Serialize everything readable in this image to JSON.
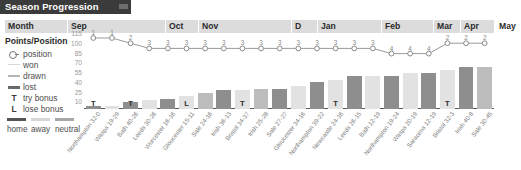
{
  "title": "Season Progression",
  "months": [
    {
      "label": "Month",
      "x": 0,
      "w": 62
    },
    {
      "label": "Sep",
      "x": 62,
      "w": 98
    },
    {
      "label": "Oct",
      "x": 160,
      "w": 33
    },
    {
      "label": "Nov",
      "x": 193,
      "w": 93
    },
    {
      "label": "D",
      "x": 286,
      "w": 26
    },
    {
      "label": "Jan",
      "x": 312,
      "w": 64
    },
    {
      "label": "Feb",
      "x": 376,
      "w": 0
    },
    {
      "label": "Mar",
      "x": 376,
      "w": 0
    },
    {
      "label": "Apr",
      "x": 376,
      "w": 0
    },
    {
      "label": "May",
      "x": 376,
      "w": 0
    }
  ],
  "legend": {
    "title": "Points/Position",
    "items": [
      {
        "glyph": "position-marker",
        "label": "position"
      },
      {
        "glyph": "line-won",
        "label": "won"
      },
      {
        "glyph": "line-drawn",
        "label": "drawn"
      },
      {
        "glyph": "line-lost",
        "label": "lost"
      },
      {
        "glyph": "T",
        "label": "try bonus"
      },
      {
        "glyph": "L",
        "label": "lose bonus"
      }
    ],
    "venue_key": [
      {
        "label": "home",
        "color": "#555555"
      },
      {
        "label": "away",
        "color": "#d6d6d6"
      },
      {
        "label": "neutral",
        "color": "#a8a8a8"
      }
    ]
  },
  "chart_data": {
    "type": "bar",
    "title": "Season Progression",
    "xlabel": "",
    "ylabel": "Points/Position",
    "ylim": [
      0,
      115
    ],
    "yticks": [
      115,
      100,
      85,
      70,
      55,
      40,
      25,
      10
    ],
    "grid": false,
    "legend_position": "left",
    "categories": [
      "Northampton 32-0",
      "Wasps 19-29",
      "Bath 40-26",
      "Leeds 30-26",
      "Worcester 16-16",
      "Gloucester 15-11",
      "Sale 24-16",
      "Irish 36-13",
      "Bristol 34-37",
      "Irish 25-28",
      "Sale 27-27",
      "Gloucester 34-16",
      "Northampton 39-22",
      "Newcastle 24-16",
      "Leeds 26-15",
      "Bath 12-19",
      "Northampton 19-24",
      "Wasps 20-19",
      "Saracens 12-19",
      "Bristol 32-3",
      "Irish 40-8",
      "Sale 30-45"
    ],
    "series": [
      {
        "name": "points",
        "type": "bar",
        "values": [
          5,
          5,
          10,
          14,
          16,
          20,
          25,
          29,
          29,
          30,
          31,
          36,
          41,
          45,
          50,
          50,
          50,
          55,
          55,
          60,
          65,
          65
        ]
      },
      {
        "name": "position",
        "type": "line",
        "values": [
          1,
          1,
          2,
          3,
          3,
          3,
          3,
          3,
          3,
          3,
          3,
          3,
          3,
          3,
          3,
          3,
          4,
          4,
          4,
          2,
          2,
          2
        ]
      }
    ],
    "venues": [
      "home",
      "away",
      "home",
      "away",
      "home",
      "away",
      "neutral",
      "home",
      "away",
      "neutral",
      "home",
      "away",
      "home",
      "away",
      "home",
      "away",
      "home",
      "away",
      "home",
      "away",
      "home",
      "neutral"
    ],
    "bonus_marks": [
      {
        "index": 0,
        "mark": "T"
      },
      {
        "index": 2,
        "mark": "T"
      },
      {
        "index": 5,
        "mark": "L"
      },
      {
        "index": 8,
        "mark": "T"
      },
      {
        "index": 13,
        "mark": "T"
      },
      {
        "index": 19,
        "mark": "T"
      }
    ]
  }
}
